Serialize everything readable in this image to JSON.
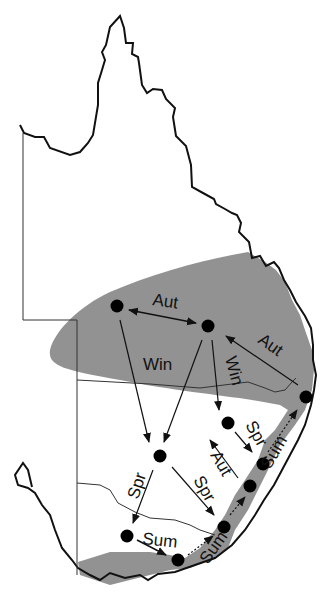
{
  "map": {
    "title": "Seasonal movement of eastern Australia",
    "shaded_color": "#8c8c8c",
    "outline_color": "#111111",
    "labels": {
      "aut_top": "Aut",
      "aut_right": "Aut",
      "win_left": "Win",
      "win_right": "Win",
      "spr_right_upper": "Spr",
      "sum_right_upper": "Sum",
      "aut_mid": "Aut",
      "spr_mid": "Spr",
      "spr_left": "Spr",
      "sum_bottom": "Sum",
      "sum_bottom_right": "Sum"
    },
    "sites": [
      {
        "id": "A",
        "x": 117,
        "y": 306
      },
      {
        "id": "B",
        "x": 208,
        "y": 326
      },
      {
        "id": "C",
        "x": 306,
        "y": 397
      },
      {
        "id": "D",
        "x": 228,
        "y": 423
      },
      {
        "id": "E",
        "x": 160,
        "y": 456
      },
      {
        "id": "F",
        "x": 263,
        "y": 464
      },
      {
        "id": "G",
        "x": 250,
        "y": 486
      },
      {
        "id": "H",
        "x": 224,
        "y": 527
      },
      {
        "id": "I",
        "x": 127,
        "y": 536
      },
      {
        "id": "J",
        "x": 178,
        "y": 560
      }
    ]
  }
}
